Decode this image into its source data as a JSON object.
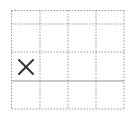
{
  "grid": {
    "columns": 4,
    "rows": 4,
    "x_lines": [
      11.5,
      40,
      68,
      96,
      124
    ],
    "y_lines": [
      10.5,
      24,
      52,
      109
    ],
    "dashed_color": "#9a9a9a",
    "solid_line": {
      "y": 81,
      "x1": 11.5,
      "x2": 124,
      "color": "#8f8f8f"
    }
  },
  "marks": [
    {
      "type": "x",
      "label": "×",
      "row": 2,
      "col": 0,
      "cx": 26,
      "cy": 67,
      "size": 14,
      "color": "#333333"
    }
  ]
}
